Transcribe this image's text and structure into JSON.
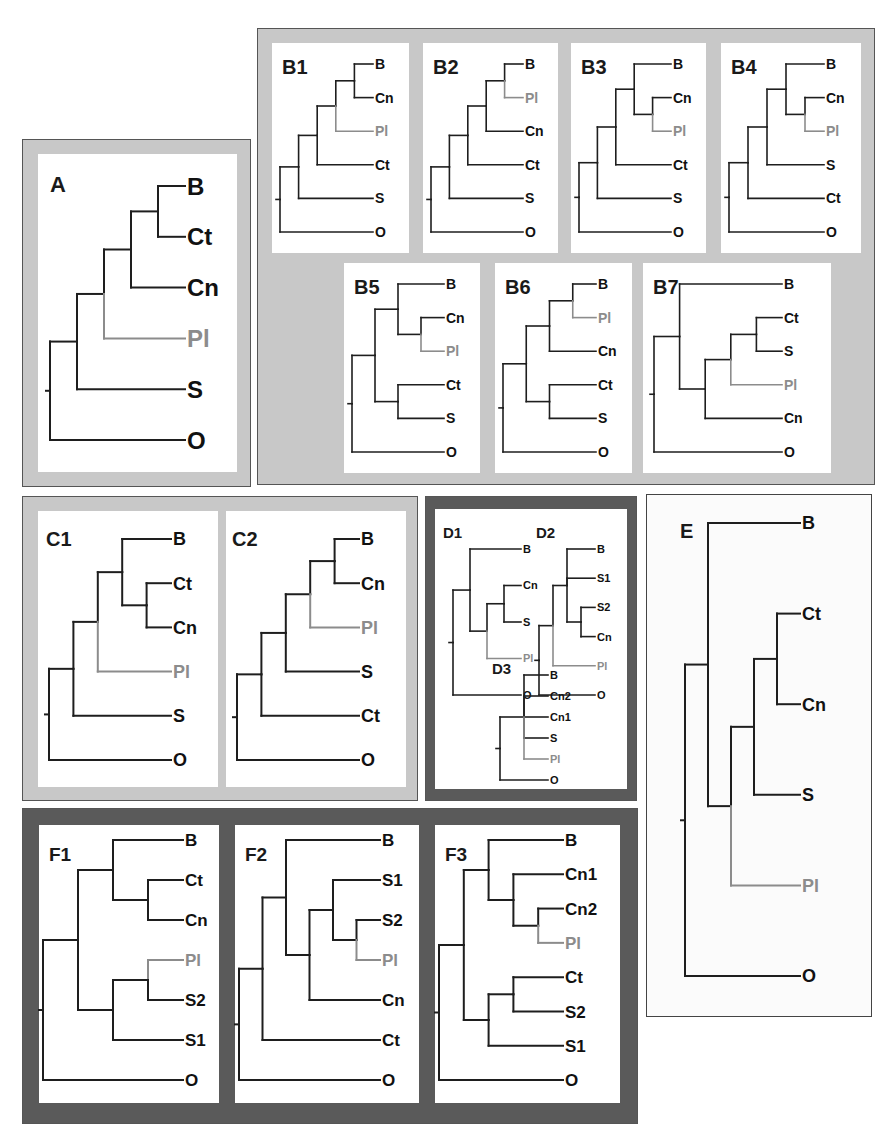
{
  "figure": {
    "title": "",
    "taxa_legend": {
      "B": "B",
      "Ct": "Ct",
      "Cn": "Cn",
      "Pl": "Pl",
      "S": "S",
      "O": "O"
    },
    "colors": {
      "line": "#1e1e1e",
      "highlight": "#8c8c8c",
      "frame_light": "#c8c8c8",
      "frame_dark": "#5a5a5a",
      "panel_bg": "#ffffff"
    }
  },
  "panels": {
    "A": {
      "label": "A",
      "newick": "(((((B,Ct),Cn),Pl),S),O)",
      "leaves": [
        "B",
        "Ct",
        "Cn",
        "Pl",
        "S",
        "O"
      ]
    },
    "B1": {
      "label": "B1",
      "newick": "(((((B,Cn),Pl),Ct),S),O)",
      "leaves": [
        "B",
        "Cn",
        "Pl",
        "Ct",
        "S",
        "O"
      ]
    },
    "B2": {
      "label": "B2",
      "newick": "(((((B,Pl),Cn),Ct),S),O)",
      "leaves": [
        "B",
        "Pl",
        "Cn",
        "Ct",
        "S",
        "O"
      ]
    },
    "B3": {
      "label": "B3",
      "newick": "((((B,(Cn,Pl)),Ct),S),O)",
      "leaves": [
        "B",
        "Cn",
        "Pl",
        "Ct",
        "S",
        "O"
      ]
    },
    "B4": {
      "label": "B4",
      "newick": "((((B,(Cn,Pl)),S),Ct),O)",
      "leaves": [
        "B",
        "Cn",
        "Pl",
        "S",
        "Ct",
        "O"
      ]
    },
    "B5": {
      "label": "B5",
      "newick": "(((B,(Cn,Pl)),(Ct,S)),O)",
      "leaves": [
        "B",
        "Cn",
        "Pl",
        "Ct",
        "S",
        "O"
      ]
    },
    "B6": {
      "label": "B6",
      "newick": "((((B,Pl),Cn),(Ct,S)),O)",
      "leaves": [
        "B",
        "Pl",
        "Cn",
        "Ct",
        "S",
        "O"
      ]
    },
    "B7": {
      "label": "B7",
      "newick": "((B,(((Ct,S),Pl),Cn)),O)",
      "leaves": [
        "B",
        "Ct",
        "S",
        "Pl",
        "Cn",
        "O"
      ]
    },
    "C1": {
      "label": "C1",
      "newick": "((((B,(Ct,Cn)),Pl),S),O)",
      "leaves": [
        "B",
        "Ct",
        "Cn",
        "Pl",
        "S",
        "O"
      ]
    },
    "C2": {
      "label": "C2",
      "newick": "(((((B,Cn),Pl),S),Ct),O)",
      "leaves": [
        "B",
        "Cn",
        "Pl",
        "S",
        "Ct",
        "O"
      ]
    },
    "D1": {
      "label": "D1",
      "newick": "((B,((Cn,S),Pl)),O)",
      "leaves": [
        "B",
        "Cn",
        "S",
        "Pl",
        "O"
      ]
    },
    "D2": {
      "label": "D2",
      "newick": "(((B,S1,(S2,Cn)),Pl),O)",
      "leaves": [
        "B",
        "S1",
        "S2",
        "Cn",
        "Pl",
        "O"
      ]
    },
    "D3": {
      "label": "D3",
      "newick": "((B,Cn2,Cn1,S,Pl),O)",
      "leaves": [
        "B",
        "Cn2",
        "Cn1",
        "S",
        "Pl",
        "O"
      ]
    },
    "E": {
      "label": "E",
      "newick": "((B,(((Ct,Cn),S),Pl)),O)",
      "leaves": [
        "B",
        "Ct",
        "Cn",
        "S",
        "Pl",
        "O"
      ]
    },
    "F1": {
      "label": "F1",
      "newick": "(((B,(Ct,Cn)),((Pl,S2),S1)),O)",
      "leaves": [
        "B",
        "Ct",
        "Cn",
        "Pl",
        "S2",
        "S1",
        "O"
      ]
    },
    "F2": {
      "label": "F2",
      "newick": "(((B,((S1,(S2,Pl)),Cn)),Ct),O)",
      "leaves": [
        "B",
        "S1",
        "S2",
        "Pl",
        "Cn",
        "Ct",
        "O"
      ]
    },
    "F3": {
      "label": "F3",
      "newick": "(((B,(Cn1,(Cn2,Pl))),((Ct,S2),S1)),O)",
      "leaves": [
        "B",
        "Cn1",
        "Cn2",
        "Pl",
        "Ct",
        "S2",
        "S1",
        "O"
      ]
    }
  }
}
